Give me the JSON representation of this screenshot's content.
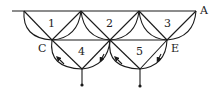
{
  "diagram": {
    "face_labels": [
      "1",
      "2",
      "3",
      "4",
      "5"
    ],
    "vertex_labels": {
      "C": "C",
      "E": "E",
      "A": "A"
    },
    "colors": {
      "stroke": "#1a1a1a",
      "background": "#ffffff"
    }
  }
}
